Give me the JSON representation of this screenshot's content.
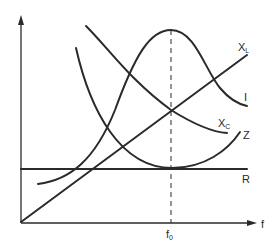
{
  "diagram": {
    "axes": {
      "x_label": "f",
      "resonance_label_main": "f",
      "resonance_label_sub": "0"
    },
    "curves": [
      {
        "id": "XL",
        "label_main": "X",
        "label_sub": "L",
        "shape": "rising straight line through origin"
      },
      {
        "id": "I",
        "label_main": "I",
        "label_sub": "",
        "shape": "bell curve peaking at f0"
      },
      {
        "id": "XC",
        "label_main": "X",
        "label_sub": "C",
        "shape": "decreasing hyperbola"
      },
      {
        "id": "Z",
        "label_main": "Z",
        "label_sub": "",
        "shape": "U-shaped with minimum equal to R at f0"
      },
      {
        "id": "R",
        "label_main": "R",
        "label_sub": "",
        "shape": "horizontal constant line"
      }
    ],
    "colors": {
      "ink": "#2a2a2a",
      "background": "#ffffff"
    }
  }
}
